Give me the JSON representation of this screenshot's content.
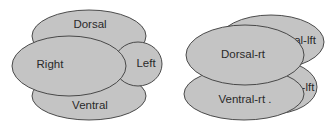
{
  "diagrams": [
    {
      "name": "four-lobe-diagram",
      "lobes": [
        {
          "label": "Dorsal"
        },
        {
          "label": "Left"
        },
        {
          "label": "Ventral"
        },
        {
          "label": "Right"
        }
      ]
    },
    {
      "name": "paired-lobe-diagram",
      "lobes": [
        {
          "label": "al-lft"
        },
        {
          "label": "-lft"
        },
        {
          "label": "Ventral-rt ."
        },
        {
          "label": "Dorsal-rt"
        }
      ]
    }
  ],
  "colors": {
    "lobe_fill": "#c4c4c4",
    "lobe_stroke": "#3a3a3a",
    "text": "#2a2a2a"
  }
}
